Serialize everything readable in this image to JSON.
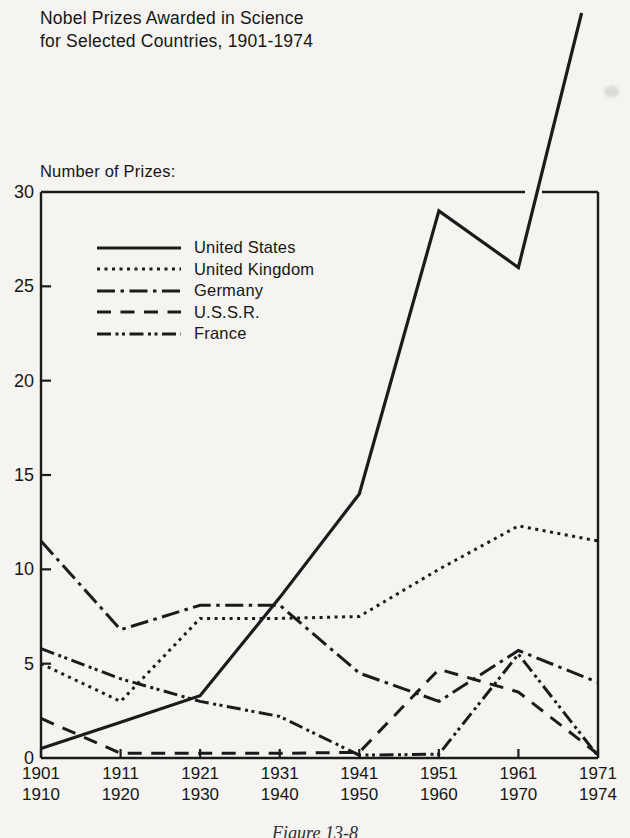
{
  "page": {
    "background_color": "#f5f4f0",
    "ink_color": "#1b1b1b",
    "caption": "Figure 13-8",
    "caption_note": "caption partially cut off at bottom edge of image"
  },
  "header": {
    "title_line1": "Nobel Prizes Awarded in Science",
    "title_line2": "for Selected Countries, 1901-1974"
  },
  "chart_data": {
    "type": "line",
    "title": "Nobel Prizes Awarded in Science for Selected Countries, 1901-1974",
    "ylabel": "Number of Prizes:",
    "xlabel": "",
    "ylim": [
      0,
      30
    ],
    "yticks": [
      0,
      5,
      10,
      15,
      20,
      25,
      30
    ],
    "grid": false,
    "legend_position": "upper-left-inside",
    "categories": [
      [
        "1901",
        "1910"
      ],
      [
        "1911",
        "1920"
      ],
      [
        "1921",
        "1930"
      ],
      [
        "1931",
        "1940"
      ],
      [
        "1941",
        "1950"
      ],
      [
        "1951",
        "1960"
      ],
      [
        "1961",
        "1970"
      ],
      [
        "1971",
        "1974"
      ]
    ],
    "series": [
      {
        "name": "United States",
        "style": "solid",
        "values": [
          0.5,
          1.9,
          3.3,
          8.5,
          14,
          29,
          26,
          43
        ],
        "last_value_estimated": true,
        "line_exits_chart_top": true
      },
      {
        "name": "United Kingdom",
        "style": "dotted",
        "values": [
          5,
          3,
          7.4,
          7.4,
          7.5,
          10,
          12.3,
          11.5
        ]
      },
      {
        "name": "Germany",
        "style": "dash-dot",
        "values": [
          11.5,
          6.8,
          8.1,
          8.1,
          4.5,
          3,
          5.7,
          4
        ]
      },
      {
        "name": "U.S.S.R.",
        "style": "long-dash",
        "values": [
          2.1,
          0.25,
          0.25,
          0.25,
          0.3,
          4.7,
          3.5,
          0.2
        ]
      },
      {
        "name": "France",
        "style": "dash-dot-dot",
        "values": [
          5.8,
          4.2,
          3,
          2.2,
          0.15,
          0.2,
          5.5,
          0.1
        ]
      }
    ]
  }
}
